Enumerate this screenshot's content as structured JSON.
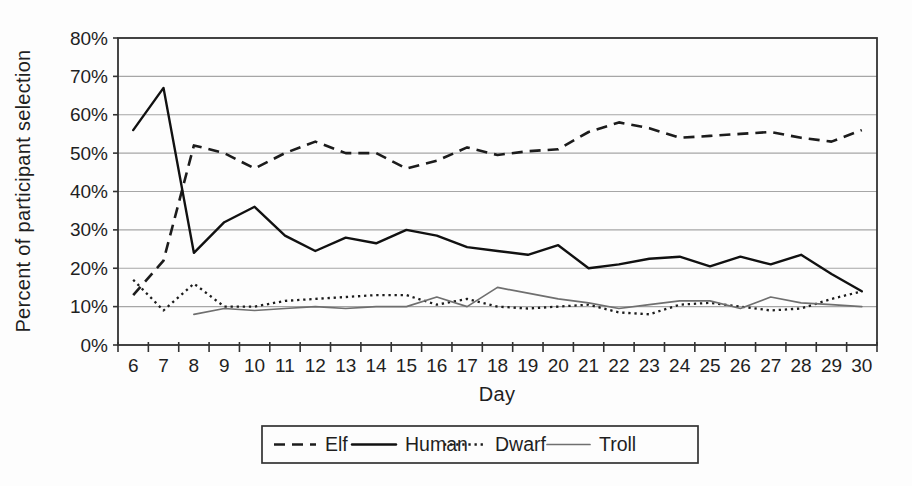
{
  "figure": {
    "background": "#fdfdfd",
    "text_color": "#1f1f1f",
    "gridline_color": "#a6a6a6",
    "border_color": "#333333"
  },
  "chart_data": {
    "type": "line",
    "title": "",
    "xlabel": "Day",
    "ylabel": "Percent of participant selection",
    "x": [
      6,
      7,
      8,
      9,
      10,
      11,
      12,
      13,
      14,
      15,
      16,
      17,
      18,
      19,
      20,
      21,
      22,
      23,
      24,
      25,
      26,
      27,
      28,
      29,
      30
    ],
    "ylim": [
      0,
      80
    ],
    "yticks": [
      {
        "value": 0,
        "label": "0%"
      },
      {
        "value": 10,
        "label": "10%"
      },
      {
        "value": 20,
        "label": "20%"
      },
      {
        "value": 30,
        "label": "30%"
      },
      {
        "value": 40,
        "label": "40%"
      },
      {
        "value": 50,
        "label": "50%"
      },
      {
        "value": 60,
        "label": "60%"
      },
      {
        "value": 70,
        "label": "70%"
      },
      {
        "value": 80,
        "label": "80%"
      }
    ],
    "grid": true,
    "legend_position": "bottom",
    "series": [
      {
        "name": "Elf",
        "style": "dashed",
        "color": "#1c1c1c",
        "values": [
          13,
          22,
          52,
          50,
          46,
          50,
          53,
          50,
          50,
          46,
          48,
          51.5,
          49.5,
          50.5,
          51,
          55.5,
          58,
          56.5,
          54,
          54.5,
          55,
          55.5,
          54,
          53,
          56
        ]
      },
      {
        "name": "Human",
        "style": "solid",
        "color": "#111111",
        "values": [
          56,
          67,
          24,
          32,
          36,
          28.5,
          24.5,
          28,
          26.5,
          30,
          28.5,
          25.5,
          24.5,
          23.5,
          26,
          20,
          21,
          22.5,
          23,
          20.5,
          23,
          21,
          23.5,
          18.5,
          14
        ]
      },
      {
        "name": "Dwarf",
        "style": "dotted",
        "color": "#1c1c1c",
        "values": [
          17,
          9,
          16,
          10,
          10,
          11.5,
          12,
          12.5,
          13,
          13,
          10.5,
          12,
          10,
          9.5,
          10,
          10.5,
          8.5,
          8,
          10.5,
          11,
          10,
          9,
          9.5,
          12,
          14
        ]
      },
      {
        "name": "Troll",
        "style": "thin-solid",
        "color": "#6f6f6f",
        "values": [
          null,
          null,
          8,
          9.5,
          9,
          9.5,
          10,
          9.5,
          10,
          10,
          12.5,
          10,
          15,
          13.5,
          12,
          11,
          9.5,
          10.5,
          11.5,
          11.5,
          9.5,
          12.5,
          11,
          10.5,
          10
        ]
      }
    ]
  }
}
